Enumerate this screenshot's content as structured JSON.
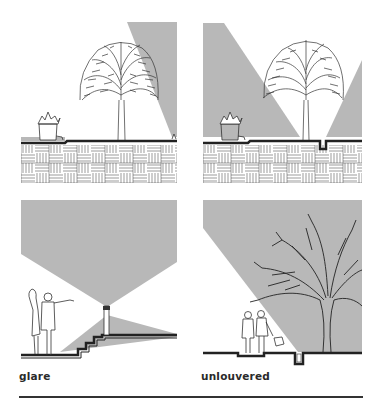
{
  "panels": [
    {
      "id": "top-left",
      "description": "tree lit by angled uplight from right edge, brick paving section"
    },
    {
      "id": "top-right",
      "description": "tree lit by in-grade fixture, light spreads in V shape"
    },
    {
      "id": "bottom-left",
      "description": "bollard light at top of stairs, people pointing",
      "label": "glare"
    },
    {
      "id": "bottom-right",
      "description": "in-grade fixture lighting large tree, people walking with dog",
      "label": "unlouvered"
    }
  ],
  "labels": {
    "glare": "glare",
    "unlouvered": "unlouvered"
  },
  "colors": {
    "light_beam": "#b8b8b8",
    "ink": "#222222",
    "background": "#ffffff"
  }
}
